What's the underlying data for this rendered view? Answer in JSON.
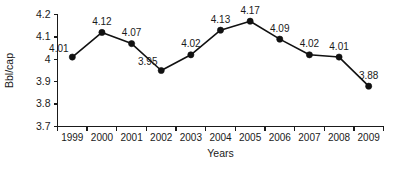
{
  "chart_data": {
    "type": "line",
    "title": "",
    "subtitle": "",
    "xlabel": "Years",
    "ylabel": "Bbl/cap",
    "categories": [
      "1999",
      "2000",
      "2001",
      "2002",
      "2003",
      "2004",
      "2005",
      "2006",
      "2007",
      "2008",
      "2009"
    ],
    "values": [
      4.01,
      4.12,
      4.07,
      3.95,
      4.02,
      4.13,
      4.17,
      4.09,
      4.02,
      4.01,
      3.88
    ],
    "point_labels": [
      "4.01",
      "4.12",
      "4.07",
      "3.95",
      "4.02",
      "4.13",
      "4.17",
      "4.09",
      "4.02",
      "4.01",
      "3.88"
    ],
    "label_positions": [
      "left",
      "above",
      "above",
      "left",
      "above",
      "above",
      "above",
      "above",
      "above",
      "above",
      "above"
    ],
    "ylim": [
      3.7,
      4.2
    ],
    "ytick_values": [
      4.2,
      4.1,
      4.0,
      3.9,
      3.8,
      3.7
    ],
    "ytick_labels": [
      "4.2",
      "4.1",
      "4",
      "3.9",
      "3.8",
      "3.7"
    ],
    "grid": false,
    "legend": null,
    "marker": "filled-circle",
    "line_color": "#111111",
    "marker_color": "#111111",
    "axis_color": "#1a1a1a",
    "background_color": "#ffffff"
  }
}
